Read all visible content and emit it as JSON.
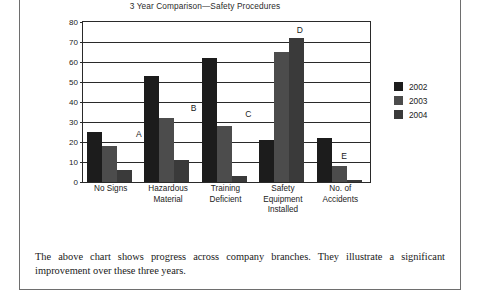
{
  "figure": {
    "title": "3 Year Comparison—Safety Procedures",
    "caption": "The above chart shows progress across company branches. They illustrate a significant improvement over these three years."
  },
  "chart_data": {
    "type": "bar",
    "title": "3 Year Comparison—Safety Procedures",
    "xlabel": "",
    "ylabel": "",
    "ylim": [
      0,
      80
    ],
    "yticks": [
      0,
      10,
      20,
      30,
      40,
      50,
      60,
      70,
      80
    ],
    "grid": true,
    "legend_position": "right",
    "categories": [
      "No Signs",
      "Hazardous Material",
      "Training Deficient",
      "Safety Equipment Installed",
      "No. of Accidents"
    ],
    "category_lines": [
      [
        "No Signs"
      ],
      [
        "Hazardous",
        "Material"
      ],
      [
        "Training",
        "Deficient"
      ],
      [
        "Safety",
        "Equipment",
        "Installed"
      ],
      [
        "No. of",
        "Accidents"
      ]
    ],
    "series": [
      {
        "name": "2002",
        "color": "#1c1c1c",
        "values": [
          25,
          53,
          62,
          21,
          22
        ]
      },
      {
        "name": "2003",
        "color": "#4c4c4c",
        "values": [
          18,
          32,
          28,
          65,
          8
        ]
      },
      {
        "name": "2004",
        "color": "#3a3a3a",
        "values": [
          6,
          11,
          3,
          72,
          1
        ]
      }
    ],
    "annotations": [
      {
        "label": "A",
        "category": "No Signs",
        "x_pct": 18.5,
        "y_value": 24
      },
      {
        "label": "B",
        "category": "Hazardous Material",
        "x_pct": 37.5,
        "y_value": 37
      },
      {
        "label": "C",
        "category": "Training Deficient",
        "x_pct": 56.5,
        "y_value": 34
      },
      {
        "label": "D",
        "category": "Safety Equipment Installed",
        "x_pct": 74.5,
        "y_value": 76
      },
      {
        "label": "E",
        "category": "No. of Accidents",
        "x_pct": 90.0,
        "y_value": 13
      }
    ]
  }
}
